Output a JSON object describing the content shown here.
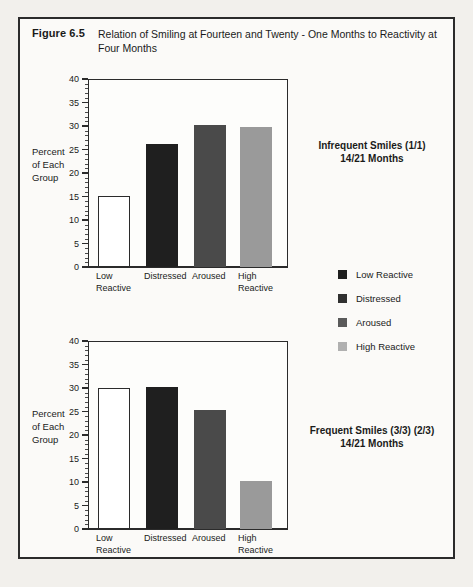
{
  "figure": {
    "label": "Figure 6.5",
    "caption": "Relation of Smiling at Fourteen and Twenty - One Months to Reactivity at Four Months"
  },
  "colors": {
    "low_reactive": "#ffffff",
    "distressed": "#1f1f1f",
    "aroused": "#4a4a4a",
    "high_reactive": "#9a9a9a",
    "outline": "#2b2b2b",
    "page_background": "#f2f0ec",
    "figure_background": "#fbfaf8"
  },
  "legend": {
    "position": "right",
    "entries": [
      {
        "label": "Low Reactive",
        "color": "#1f1f1f"
      },
      {
        "label": "Distressed",
        "color": "#303030"
      },
      {
        "label": "Aroused",
        "color": "#5a5a5a"
      },
      {
        "label": "High Reactive",
        "color": "#b0b0b0"
      }
    ]
  },
  "axis": {
    "ylabel_lines": [
      "Percent",
      "of Each",
      "Group"
    ],
    "ticks": [
      "0",
      "5",
      "10",
      "15",
      "20",
      "25",
      "30",
      "35",
      "40"
    ]
  },
  "chart_data": [
    {
      "type": "bar",
      "title": "Infrequent Smiles (1/1)\n14/21 Months",
      "annotation_lines": [
        "Infrequent Smiles (1/1)",
        "14/21 Months"
      ],
      "categories": [
        "Low Reactive",
        "Distressed",
        "Aroused",
        "High Reactive"
      ],
      "category_lines": [
        [
          "Low",
          "Reactive"
        ],
        [
          "Distressed"
        ],
        [
          "Aroused"
        ],
        [
          "High",
          "Reactive"
        ]
      ],
      "values": [
        15.2,
        26.2,
        30.3,
        29.8
      ],
      "colors": [
        "#ffffff",
        "#1f1f1f",
        "#4a4a4a",
        "#9a9a9a"
      ],
      "xlabel": "",
      "ylabel": "Percent of Each Group",
      "ylim": [
        0,
        40
      ],
      "ytick_step": 5,
      "minor_ticks_per_interval": 4,
      "grid": false
    },
    {
      "type": "bar",
      "title": "Frequent Smiles (3/3) (2/3)\n14/21 Months",
      "annotation_lines": [
        "Frequent Smiles (3/3) (2/3)",
        "14/21 Months"
      ],
      "categories": [
        "Low Reactive",
        "Distressed",
        "Aroused",
        "High Reactive"
      ],
      "category_lines": [
        [
          "Low",
          "Reactive"
        ],
        [
          "Distressed"
        ],
        [
          "Aroused"
        ],
        [
          "High",
          "Reactive"
        ]
      ],
      "values": [
        30.1,
        30.2,
        25.3,
        10.2
      ],
      "colors": [
        "#ffffff",
        "#1f1f1f",
        "#4a4a4a",
        "#9a9a9a"
      ],
      "xlabel": "",
      "ylabel": "Percent of Each Group",
      "ylim": [
        0,
        40
      ],
      "ytick_step": 5,
      "minor_ticks_per_interval": 4,
      "grid": false
    }
  ]
}
